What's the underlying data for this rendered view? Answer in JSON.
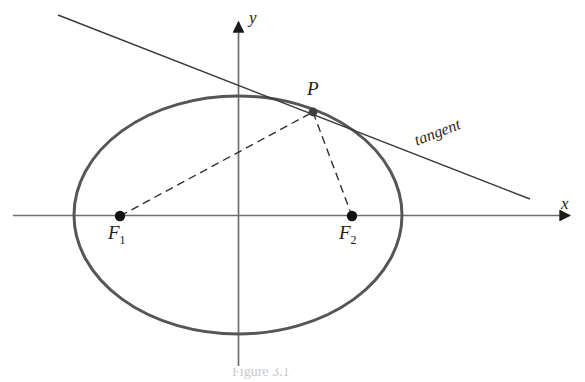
{
  "figure": {
    "type": "geometry-diagram",
    "background_color": "#ffffff",
    "width": 585,
    "height": 382,
    "caption_partial": "Figure 3.1"
  },
  "labels": {
    "y_axis": "y",
    "x_axis": "x",
    "point_p": "P",
    "focus_1_letter": "F",
    "focus_1_index": "1",
    "focus_2_letter": "F",
    "focus_2_index": "2",
    "tangent": "tangent"
  },
  "colors": {
    "ellipse_stroke": "#565656",
    "axis_stroke": "#6e6e6e",
    "tangent_stroke": "#3a3a3a",
    "dashed_stroke": "#303030",
    "point_fill": "#111111",
    "label_text": "#1c1c1c",
    "caption_text": "#c9c9c9"
  },
  "geometry": {
    "ellipse": {
      "cx": 238,
      "cy": 215,
      "rx": 164,
      "ry": 119,
      "stroke_width": 3
    },
    "x_axis": {
      "x1": 13,
      "y1": 215,
      "x2": 572,
      "y2": 215,
      "stroke_width": 1.6,
      "arrow": "right"
    },
    "y_axis": {
      "x1": 238,
      "y1": 366,
      "x2": 238,
      "y2": 20,
      "stroke_width": 1.6,
      "arrow": "up"
    },
    "tangent_line": {
      "x1": 58,
      "y1": 15,
      "x2": 530,
      "y2": 199,
      "stroke_width": 1.4
    },
    "point_P": {
      "x": 313,
      "y": 112,
      "r": 4.2
    },
    "focus_F1": {
      "x": 120,
      "y": 216,
      "r": 5
    },
    "focus_F2": {
      "x": 352,
      "y": 216,
      "r": 5
    },
    "segment_F1_P": {
      "x1": 120,
      "y1": 216,
      "x2": 313,
      "y2": 112,
      "dash": "8 5"
    },
    "segment_P_F2": {
      "x1": 313,
      "y1": 112,
      "x2": 352,
      "y2": 216,
      "dash": "8 5"
    },
    "tangent_label_rotation_deg": -21
  },
  "label_positions": {
    "y_axis": {
      "left": 249,
      "top": 9
    },
    "x_axis": {
      "left": 561,
      "top": 196
    },
    "point_p": {
      "left": 307,
      "top": 79
    },
    "focus_1": {
      "left": 108,
      "top": 222
    },
    "focus_2": {
      "left": 339,
      "top": 222
    },
    "tangent": {
      "left": 415,
      "top": 132
    }
  }
}
